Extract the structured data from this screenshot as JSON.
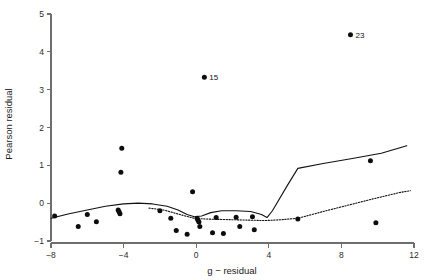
{
  "chart_data": {
    "type": "scatter",
    "title": "",
    "xlabel": "g − residual",
    "ylabel": "Pearson residual",
    "xlim": [
      -8,
      12
    ],
    "ylim": [
      -1,
      5
    ],
    "xticks": [
      -8,
      -4,
      0,
      4,
      8,
      12
    ],
    "xtick_labels": [
      "−8",
      "−4",
      "0",
      "4",
      "8",
      "12"
    ],
    "yticks": [
      -1,
      0,
      1,
      2,
      3,
      4,
      5
    ],
    "ytick_labels": [
      "−1",
      "0",
      "1",
      "2",
      "3",
      "4",
      "5"
    ],
    "grid": false,
    "legend": null,
    "points": [
      {
        "x": -7.8,
        "y": -0.34
      },
      {
        "x": -6.0,
        "y": -0.3
      },
      {
        "x": -6.5,
        "y": -0.62
      },
      {
        "x": -5.5,
        "y": -0.49
      },
      {
        "x": -4.3,
        "y": -0.18
      },
      {
        "x": -4.2,
        "y": -0.28
      },
      {
        "x": -4.25,
        "y": -0.23
      },
      {
        "x": -4.1,
        "y": 1.45
      },
      {
        "x": -4.15,
        "y": 0.82
      },
      {
        "x": -2.0,
        "y": -0.2
      },
      {
        "x": -1.4,
        "y": -0.4
      },
      {
        "x": -1.1,
        "y": -0.72
      },
      {
        "x": -0.5,
        "y": -0.82
      },
      {
        "x": -0.2,
        "y": 0.3
      },
      {
        "x": 0.05,
        "y": -0.4
      },
      {
        "x": 0.15,
        "y": -0.5
      },
      {
        "x": 0.1,
        "y": -0.45
      },
      {
        "x": 0.2,
        "y": -0.62
      },
      {
        "x": 0.9,
        "y": -0.78
      },
      {
        "x": 1.1,
        "y": -0.38
      },
      {
        "x": 1.5,
        "y": -0.8
      },
      {
        "x": 2.2,
        "y": -0.37
      },
      {
        "x": 2.4,
        "y": -0.62
      },
      {
        "x": 3.1,
        "y": -0.36
      },
      {
        "x": 3.2,
        "y": -0.7
      },
      {
        "x": 5.6,
        "y": -0.42
      },
      {
        "x": 9.9,
        "y": -0.52
      },
      {
        "x": 0.45,
        "y": 3.33,
        "label": "15"
      },
      {
        "x": 8.5,
        "y": 4.45,
        "label": "23"
      },
      {
        "x": 9.6,
        "y": 1.12
      }
    ],
    "curves": [
      {
        "name": "solid-fit",
        "style": "solid",
        "points": [
          [
            -8.0,
            -0.4
          ],
          [
            -7.0,
            -0.28
          ],
          [
            -6.0,
            -0.18
          ],
          [
            -5.0,
            -0.08
          ],
          [
            -4.0,
            -0.02
          ],
          [
            -3.2,
            0.0
          ],
          [
            -2.4,
            -0.02
          ],
          [
            -1.6,
            -0.08
          ],
          [
            -1.0,
            -0.18
          ],
          [
            -0.5,
            -0.3
          ],
          [
            -0.1,
            -0.36
          ],
          [
            0.3,
            -0.34
          ],
          [
            0.8,
            -0.25
          ],
          [
            1.4,
            -0.2
          ],
          [
            2.2,
            -0.2
          ],
          [
            3.0,
            -0.22
          ],
          [
            3.6,
            -0.3
          ],
          [
            3.9,
            -0.38
          ],
          [
            4.2,
            -0.2
          ],
          [
            5.0,
            0.45
          ],
          [
            5.6,
            0.92
          ],
          [
            7.0,
            1.05
          ],
          [
            8.6,
            1.18
          ],
          [
            10.2,
            1.32
          ],
          [
            11.6,
            1.52
          ]
        ]
      },
      {
        "name": "dotted-fit",
        "style": "dotted",
        "points": [
          [
            -2.6,
            -0.13
          ],
          [
            -1.8,
            -0.18
          ],
          [
            -1.2,
            -0.26
          ],
          [
            -0.6,
            -0.34
          ],
          [
            -0.1,
            -0.4
          ],
          [
            0.6,
            -0.42
          ],
          [
            1.4,
            -0.43
          ],
          [
            2.2,
            -0.44
          ],
          [
            3.0,
            -0.45
          ],
          [
            3.8,
            -0.46
          ],
          [
            4.6,
            -0.44
          ],
          [
            5.6,
            -0.4
          ],
          [
            7.0,
            -0.22
          ],
          [
            8.4,
            -0.05
          ],
          [
            9.8,
            0.12
          ],
          [
            11.2,
            0.28
          ],
          [
            11.8,
            0.33
          ]
        ]
      }
    ]
  },
  "axes": {
    "x_axis_name": "g − residual",
    "y_axis_name": "Pearson residual"
  },
  "colors": {
    "background": "#ffffff",
    "axis": "#6e6e6e",
    "marker": "#0d0d0d",
    "curve": "#111111",
    "text": "#1a1a1a"
  }
}
